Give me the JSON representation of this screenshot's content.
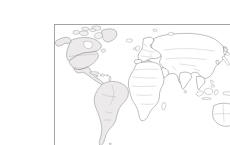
{
  "document": {
    "type": "map",
    "title": "Blank World Outline Map",
    "has_labels": false,
    "label_text": ""
  },
  "map": {
    "projection": "equirectangular",
    "frame": {
      "x": 14,
      "y": 8,
      "width": 203,
      "height": 129
    },
    "background_color": "#ffffff",
    "ocean_color": "#ffffff",
    "frame_color": "#9a9a9a",
    "coastline_color": "#6f6f6f",
    "border_color": "#a3a3a3",
    "shaded_land_color": "#eceaea",
    "plain_land_color": "#ffffff",
    "regions": [
      {
        "name": "greenland",
        "label": "Greenland",
        "shaded": true
      },
      {
        "name": "canadian-arctic",
        "label": "Canadian Arctic Archipelago",
        "shaded": true
      },
      {
        "name": "north-america",
        "label": "North America",
        "shaded": true
      },
      {
        "name": "central-america",
        "label": "Central America",
        "shaded": true
      },
      {
        "name": "caribbean",
        "label": "Caribbean Islands",
        "shaded": true
      },
      {
        "name": "south-america",
        "label": "South America",
        "shaded": true
      },
      {
        "name": "iceland",
        "label": "Iceland",
        "shaded": false
      },
      {
        "name": "british-isles",
        "label": "British Isles",
        "shaded": false
      },
      {
        "name": "europe",
        "label": "Europe",
        "shaded": false
      },
      {
        "name": "africa",
        "label": "Africa",
        "shaded": false
      },
      {
        "name": "madagascar",
        "label": "Madagascar",
        "shaded": false
      },
      {
        "name": "asia",
        "label": "Asia",
        "shaded": false
      },
      {
        "name": "arabian-peninsula",
        "label": "Arabian Peninsula",
        "shaded": false
      },
      {
        "name": "india",
        "label": "Indian Subcontinent",
        "shaded": false
      },
      {
        "name": "sri-lanka",
        "label": "Sri Lanka",
        "shaded": false
      },
      {
        "name": "japan",
        "label": "Japan",
        "shaded": false
      },
      {
        "name": "philippines",
        "label": "Philippines",
        "shaded": false
      },
      {
        "name": "indonesia",
        "label": "Indonesia",
        "shaded": false
      },
      {
        "name": "new-guinea",
        "label": "New Guinea",
        "shaded": false
      },
      {
        "name": "australia",
        "label": "Australia",
        "shaded": false
      },
      {
        "name": "new-zealand",
        "label": "New Zealand",
        "shaded": false
      },
      {
        "name": "novaya-zemlya",
        "label": "Novaya Zemlya",
        "shaded": false
      },
      {
        "name": "svalbard",
        "label": "Svalbard",
        "shaded": false
      }
    ]
  }
}
